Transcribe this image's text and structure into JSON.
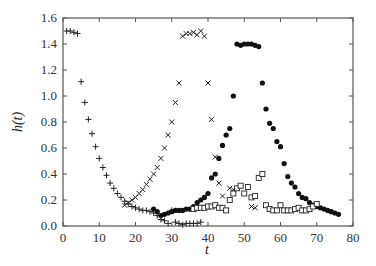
{
  "chart_data": {
    "type": "scatter",
    "title": "",
    "xlabel": "t",
    "ylabel": "h(t)",
    "xlim": [
      0,
      80
    ],
    "ylim": [
      0,
      1.6
    ],
    "xticks": [
      0,
      10,
      20,
      30,
      40,
      50,
      60,
      70,
      80
    ],
    "yticks": [
      0.0,
      0.2,
      0.4,
      0.6,
      0.8,
      1.0,
      1.2,
      1.4,
      1.6
    ],
    "ytick_labels": [
      "0.0",
      "0.2",
      "0.4",
      "0.6",
      "0.8",
      "1.0",
      "1.2",
      "1.4",
      "1.6"
    ],
    "grid": false,
    "legend": null,
    "series": [
      {
        "name": "plus",
        "marker": "+",
        "x": [
          1,
          2,
          3,
          4,
          5,
          6,
          7,
          8,
          9,
          10,
          11,
          12,
          13,
          14,
          15,
          16,
          17,
          18,
          19,
          20,
          21,
          22,
          23,
          24,
          25,
          26,
          27,
          28,
          29,
          30,
          31,
          32,
          33,
          34,
          35,
          36,
          37,
          38
        ],
        "y": [
          1.5,
          1.5,
          1.49,
          1.48,
          1.11,
          0.95,
          0.82,
          0.71,
          0.61,
          0.52,
          0.45,
          0.39,
          0.33,
          0.29,
          0.25,
          0.22,
          0.19,
          0.17,
          0.15,
          0.14,
          0.13,
          0.12,
          0.12,
          0.11,
          0.1,
          0.08,
          0.05,
          0.04,
          0.02,
          0.12,
          0.03,
          0.02,
          0.01,
          0.02,
          0.02,
          0.02,
          0.02,
          0.03
        ]
      },
      {
        "name": "cross",
        "marker": "x",
        "x": [
          17,
          18,
          19,
          20,
          21,
          22,
          23,
          24,
          25,
          26,
          27,
          28,
          29,
          30,
          31,
          32,
          33,
          34,
          35,
          36,
          37,
          38,
          39,
          40,
          41,
          42,
          43,
          44,
          46,
          47,
          52,
          53
        ],
        "y": [
          0.16,
          0.18,
          0.2,
          0.22,
          0.25,
          0.28,
          0.32,
          0.36,
          0.4,
          0.45,
          0.52,
          0.6,
          0.7,
          0.8,
          0.95,
          1.1,
          1.46,
          1.48,
          1.48,
          1.49,
          1.47,
          1.5,
          1.46,
          1.1,
          0.82,
          0.53,
          0.33,
          0.23,
          0.29,
          0.28,
          0.15,
          0.14
        ]
      },
      {
        "name": "filled-circle",
        "marker": "o",
        "x": [
          25,
          26,
          27,
          28,
          29,
          30,
          31,
          32,
          33,
          34,
          35,
          36,
          37,
          38,
          39,
          40,
          41,
          42,
          43,
          44,
          45,
          46,
          47,
          48,
          49,
          50,
          51,
          52,
          53,
          54,
          55,
          56,
          57,
          58,
          59,
          60,
          61,
          62,
          63,
          64,
          65,
          66,
          67,
          68,
          69,
          70,
          71,
          72,
          73,
          74,
          75,
          76
        ],
        "y": [
          0.13,
          0.11,
          0.08,
          0.09,
          0.1,
          0.11,
          0.12,
          0.12,
          0.12,
          0.13,
          0.13,
          0.15,
          0.18,
          0.2,
          0.22,
          0.25,
          0.37,
          0.4,
          0.52,
          0.62,
          0.7,
          0.75,
          1.0,
          1.4,
          1.39,
          1.4,
          1.4,
          1.4,
          1.39,
          1.38,
          1.1,
          0.9,
          0.79,
          0.75,
          0.65,
          0.61,
          0.48,
          0.38,
          0.33,
          0.3,
          0.25,
          0.22,
          0.21,
          0.18,
          0.16,
          0.15,
          0.14,
          0.13,
          0.12,
          0.11,
          0.1,
          0.09
        ]
      },
      {
        "name": "open-square",
        "marker": "s",
        "x": [
          36,
          37,
          38,
          39,
          40,
          41,
          42,
          43,
          44,
          45,
          46,
          47,
          48,
          49,
          50,
          51,
          52,
          53,
          54,
          55,
          56,
          57,
          58,
          59,
          60,
          61,
          62,
          63,
          64,
          65,
          66,
          67,
          68,
          69,
          70
        ],
        "y": [
          0.13,
          0.14,
          0.14,
          0.14,
          0.15,
          0.15,
          0.16,
          0.14,
          0.14,
          0.12,
          0.2,
          0.25,
          0.29,
          0.31,
          0.25,
          0.3,
          0.22,
          0.23,
          0.37,
          0.4,
          0.16,
          0.13,
          0.12,
          0.12,
          0.16,
          0.12,
          0.12,
          0.12,
          0.13,
          0.14,
          0.12,
          0.12,
          0.13,
          0.15,
          0.17
        ]
      }
    ]
  }
}
